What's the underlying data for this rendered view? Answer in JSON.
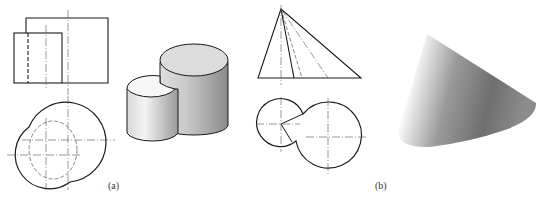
{
  "figure": {
    "panels": [
      {
        "id": "a",
        "label": "(a)",
        "description": "Orthographic front and top views of two intersecting vertical cylinders, with isometric shaded rendering",
        "views": [
          "front-view",
          "top-view",
          "isometric-render"
        ]
      },
      {
        "id": "b",
        "label": "(b)",
        "description": "Orthographic front and top views of an oblique cone, with shaded 3D rendering",
        "views": [
          "front-view",
          "top-view",
          "shaded-render"
        ]
      }
    ],
    "colors": {
      "line": "#1a1a1a",
      "centerline": "#555555",
      "hidden_line": "#444444",
      "shade_light": "#f2f2f2",
      "shade_dark": "#8c8c8c"
    }
  }
}
